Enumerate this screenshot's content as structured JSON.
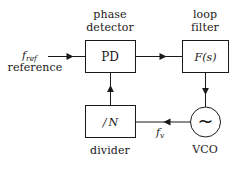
{
  "figure": {
    "name": "pll-block-diagram",
    "background_color": "#ffffff",
    "line_color": "#1a1a1a"
  },
  "blocks": {
    "phase_detector": {
      "caption_line1": "phase",
      "caption_line2": "detector",
      "box_label": "PD"
    },
    "loop_filter": {
      "caption_line1": "loop",
      "caption_line2": "filter",
      "box_label_f": "F",
      "box_label_paren_open": "(",
      "box_label_s": "s",
      "box_label_paren_close": ")"
    },
    "divider": {
      "caption": "divider",
      "box_label_slash": "/",
      "box_label_n": "N"
    },
    "vco": {
      "caption": "VCO",
      "symbol": "~"
    }
  },
  "signals": {
    "f_ref": {
      "symbol_base": "f",
      "symbol_sub": "ref",
      "caption": "reference"
    },
    "f_v": {
      "symbol_base": "f",
      "symbol_sub": "v"
    }
  },
  "icons": {
    "arrow_right_pd_in": "arrow-right-icon",
    "arrow_right_pd_to_filter": "arrow-right-icon",
    "arrow_down_filter_to_vco": "arrow-down-icon",
    "arrow_left_vco_to_divider": "arrow-left-icon",
    "arrow_up_divider_to_pd": "arrow-up-icon",
    "sine_wave": "sine-wave-icon"
  }
}
